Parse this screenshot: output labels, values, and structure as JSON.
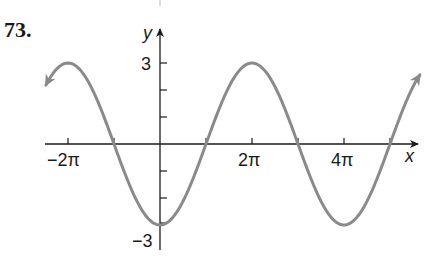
{
  "problem": {
    "number": "73."
  },
  "chart_data": {
    "type": "line",
    "title": "",
    "xlabel": "x",
    "ylabel": "y",
    "function": "y = -3cos(x/2)",
    "xlim": [
      "-2.4π",
      "5.6π"
    ],
    "ylim": [
      -3,
      3
    ],
    "x_tick_labels": [
      "−2π",
      "2π",
      "4π"
    ],
    "x_ticks": [
      "-2π",
      "-π",
      "π",
      "2π",
      "3π",
      "4π",
      "5π"
    ],
    "y_tick_labels": [
      "3",
      "−3"
    ],
    "y_ticks": [
      3,
      2,
      1,
      -1,
      -2,
      -3
    ],
    "series": [
      {
        "name": "curve",
        "x": [
          "-2π",
          "-π",
          "0",
          "π",
          "2π",
          "3π",
          "4π",
          "5π"
        ],
        "values": [
          3,
          0,
          -3,
          0,
          3,
          0,
          -3,
          0
        ]
      }
    ],
    "arrows_on_both_ends": true,
    "grid": false,
    "curve_color": "#8a8a8a",
    "axis_color": "#1a1a1a"
  },
  "labels": {
    "y_axis": "y",
    "x_axis": "x",
    "y_top": "3",
    "y_bottom": "−3",
    "x_neg2pi": "−2π",
    "x_2pi": "2π",
    "x_4pi": "4π"
  }
}
